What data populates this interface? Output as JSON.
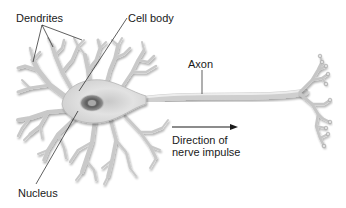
{
  "diagram": {
    "labels": {
      "dendrites": "Dendrites",
      "cell_body": "Cell body",
      "axon": "Axon",
      "direction_line1": "Direction of",
      "direction_line2": "nerve impulse",
      "nucleus": "Nucleus"
    },
    "arrow": {
      "direction": "right"
    },
    "colors": {
      "background": "#ffffff",
      "neuron_fill": "#d9d9d9",
      "neuron_outline": "#8a8a8a",
      "nucleus": "#6e6e6e",
      "text": "#1a1a1a",
      "leader_lines": "#1a1a1a"
    }
  }
}
